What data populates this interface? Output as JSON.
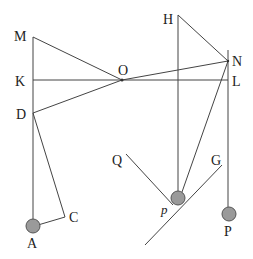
{
  "diagram": {
    "type": "geometry-mechanics-diagram",
    "labels": {
      "M": "M",
      "K": "K",
      "D": "D",
      "A": "A",
      "C": "C",
      "O": "O",
      "H": "H",
      "N": "N",
      "L": "L",
      "Q": "Q",
      "G": "G",
      "p": "p",
      "P": "P"
    },
    "colors": {
      "line": "#444444",
      "ball_fill": "#9a9a9a",
      "ball_stroke": "#555555",
      "text": "#222222"
    }
  }
}
